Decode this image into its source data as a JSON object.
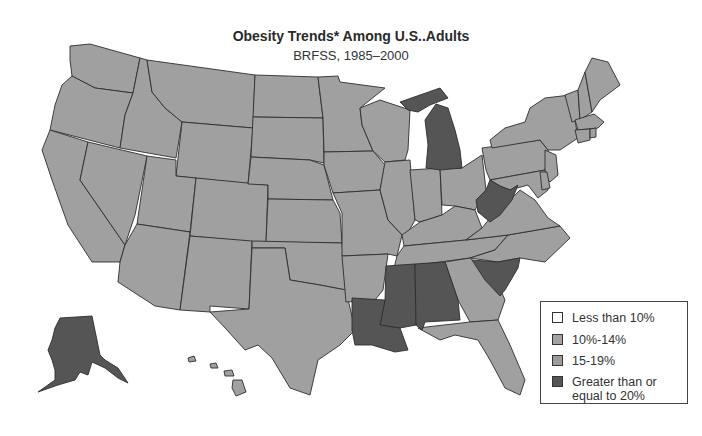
{
  "title": "Obesity Trends* Among U.S..Adults",
  "subtitle": "BRFSS, 1985–2000",
  "colors": {
    "less_than_10": "#ffffff",
    "10_14": "#a2a2a2",
    "15_19": "#9c9c9c",
    "ge_20": "#555555",
    "border": "#2e2e2e",
    "background": "#ffffff"
  },
  "legend": {
    "items": [
      {
        "label": "Less than 10%",
        "color": "#ffffff"
      },
      {
        "label": "10%-14%",
        "color": "#a2a2a2"
      },
      {
        "label": "15-19%",
        "color": "#9c9c9c"
      },
      {
        "label": "Greater than or equal to 20%",
        "line1": "Greater than or",
        "line2": "equal to 20%",
        "color": "#555555"
      }
    ]
  },
  "map": {
    "states_ge_20": [
      "Alaska",
      "Michigan",
      "West Virginia",
      "South Carolina",
      "Alabama",
      "Mississippi",
      "Louisiana"
    ],
    "states_mid_gray": [
      "Washington",
      "Oregon",
      "California",
      "Nevada",
      "Idaho",
      "Montana",
      "Wyoming",
      "Utah",
      "Arizona",
      "Colorado",
      "New Mexico",
      "North Dakota",
      "South Dakota",
      "Nebraska",
      "Kansas",
      "Oklahoma",
      "Texas",
      "Minnesota",
      "Iowa",
      "Missouri",
      "Arkansas",
      "Wisconsin",
      "Illinois",
      "Indiana",
      "Ohio",
      "Kentucky",
      "Tennessee",
      "Georgia",
      "Florida",
      "North Carolina",
      "Virginia",
      "Pennsylvania",
      "New York",
      "New Jersey",
      "Delaware",
      "Maryland",
      "Connecticut",
      "Rhode Island",
      "Massachusetts",
      "Vermont",
      "New Hampshire",
      "Maine",
      "Hawaii"
    ]
  }
}
